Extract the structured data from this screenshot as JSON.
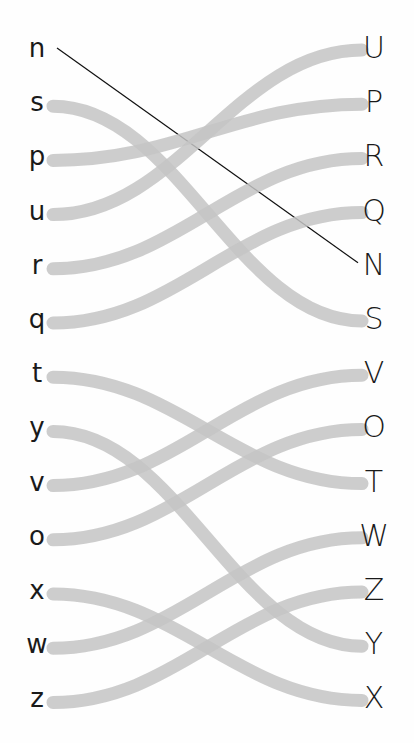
{
  "worksheet": {
    "title": "Match lowercase to uppercase",
    "left_letters": [
      "n",
      "s",
      "p",
      "u",
      "r",
      "q",
      "t",
      "y",
      "v",
      "o",
      "x",
      "w",
      "z"
    ],
    "right_letters": [
      "U",
      "P",
      "R",
      "Q",
      "N",
      "S",
      "V",
      "O",
      "T",
      "W",
      "Z",
      "Y",
      "X"
    ],
    "connections": [
      {
        "from": "n",
        "to": "N",
        "style": "pen"
      },
      {
        "from": "s",
        "to": "S",
        "style": "highlighter"
      },
      {
        "from": "p",
        "to": "P",
        "style": "highlighter"
      },
      {
        "from": "u",
        "to": "U",
        "style": "highlighter"
      },
      {
        "from": "r",
        "to": "R",
        "style": "highlighter"
      },
      {
        "from": "q",
        "to": "Q",
        "style": "highlighter"
      },
      {
        "from": "t",
        "to": "T",
        "style": "highlighter"
      },
      {
        "from": "y",
        "to": "Y",
        "style": "highlighter"
      },
      {
        "from": "v",
        "to": "V",
        "style": "highlighter"
      },
      {
        "from": "o",
        "to": "O",
        "style": "highlighter"
      },
      {
        "from": "x",
        "to": "X",
        "style": "highlighter"
      },
      {
        "from": "w",
        "to": "W",
        "style": "highlighter"
      },
      {
        "from": "z",
        "to": "Z",
        "style": "highlighter"
      }
    ],
    "colors": {
      "highlighter": "#c4c4c4",
      "pen": "#111111",
      "text": "#1a1a1a",
      "background": "#fefefe"
    }
  }
}
